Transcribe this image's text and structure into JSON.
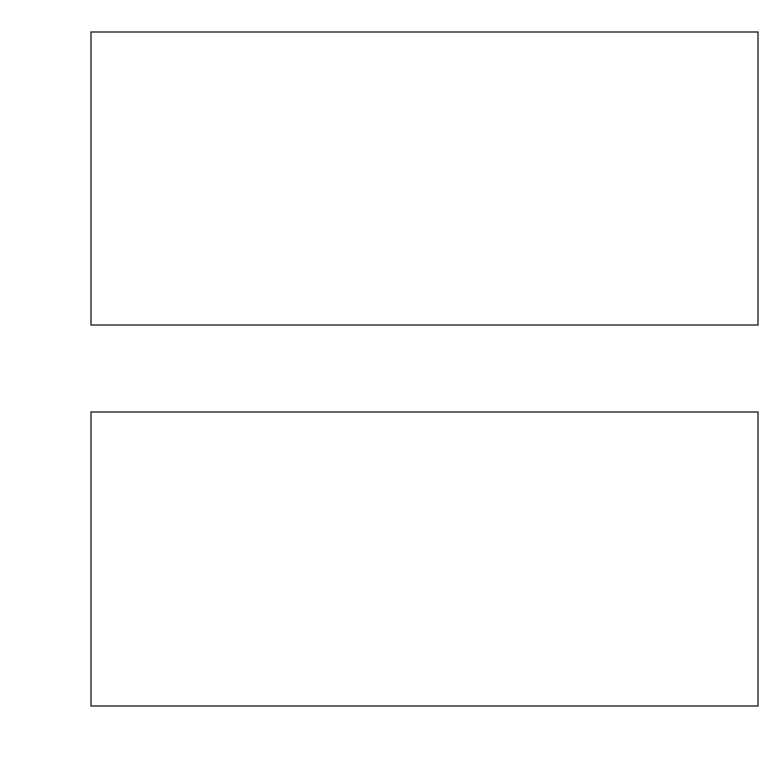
{
  "figure": {
    "background": "#ffffff",
    "line_color": "#1a1a1a",
    "hatch_color": "#2b2b2b",
    "clipped_caption": "planets per per"
  },
  "panels": [
    {
      "id": "top-panel",
      "name": "radial-distribution-panel",
      "xlabel": "R (kpc)",
      "ylabel_parts": {
        "pre": "N",
        "sub": "planets",
        "post": " / 0.1 kpc"
      },
      "ylabel_text": "N_planets / 0.1 kpc",
      "x_ticks": [
        "6",
        "7",
        "8",
        "9",
        "10"
      ],
      "y_ticks": [
        "0",
        "10",
        "2×10",
        "3×10",
        "4×10",
        "5×10"
      ],
      "y_tick_labels": [
        {
          "mantissa": "0",
          "exp": ""
        },
        {
          "mantissa": "10",
          "exp": "5"
        },
        {
          "mantissa": "2×10",
          "exp": "5"
        },
        {
          "mantissa": "3×10",
          "exp": "5"
        },
        {
          "mantissa": "4×10",
          "exp": "5"
        },
        {
          "mantissa": "5×10",
          "exp": "5"
        }
      ]
    },
    {
      "id": "bottom-panel",
      "name": "metallicity-distribution-panel",
      "xlabel": "[M/H]",
      "ylabel_parts": {
        "pre": "N",
        "sub": "planets",
        "post": "/0.1 dex"
      },
      "ylabel_text": "N_planets/0.1 dex",
      "x_ticks": [
        "-0.4",
        "-0.2",
        "0",
        "0.2",
        "0.4"
      ],
      "y_tick_labels": [
        {
          "mantissa": "0",
          "exp": ""
        },
        {
          "mantissa": "10",
          "exp": "6"
        },
        {
          "mantissa": "2×10",
          "exp": "6"
        }
      ]
    }
  ],
  "chart_data": [
    {
      "type": "area",
      "id": "radial-profile",
      "title": "",
      "xlabel": "R (kpc)",
      "ylabel": "N_planets / 0.1 kpc",
      "xlim": [
        5.955,
        10.11
      ],
      "ylim": [
        0,
        500000
      ],
      "xticks": [
        6,
        7,
        8,
        9,
        10
      ],
      "yticks": [
        0,
        100000,
        200000,
        300000,
        400000,
        500000
      ],
      "grid": false,
      "legend": null,
      "fill": "hatched-diagonal",
      "x": [
        5.955,
        6.1,
        6.3,
        6.5,
        6.7,
        6.9,
        7.1,
        7.3,
        7.5,
        7.7,
        7.9,
        8.1,
        8.3,
        8.5,
        8.7,
        8.9,
        9.1,
        9.3,
        9.5,
        9.7,
        9.9,
        10.11
      ],
      "y": [
        359000,
        350000,
        336000,
        322000,
        308000,
        295000,
        282000,
        269000,
        256000,
        244000,
        232000,
        221000,
        211000,
        201000,
        191000,
        182000,
        173000,
        164000,
        156000,
        148000,
        140000,
        132000
      ]
    },
    {
      "type": "bar",
      "id": "metallicity-histogram",
      "title": "",
      "xlabel": "[M/H]",
      "ylabel": "N_planets/0.1 dex",
      "xlim": [
        -0.545,
        0.45
      ],
      "ylim": [
        0,
        2720000
      ],
      "xticks": [
        -0.4,
        -0.2,
        0,
        0.2,
        0.4
      ],
      "yticks": [
        0,
        1000000,
        2000000
      ],
      "grid": false,
      "legend": null,
      "bin_width": 0.1,
      "fill": "hatched-diagonal",
      "bin_edges": [
        -0.545,
        -0.45,
        -0.35,
        -0.25,
        -0.15,
        -0.05,
        0.05,
        0.15,
        0.25,
        0.35,
        0.45
      ],
      "categories": [
        "-0.50",
        "-0.40",
        "-0.30",
        "-0.20",
        "-0.10",
        "0.00",
        "0.10",
        "0.20",
        "0.30",
        "0.40"
      ],
      "values": [
        2200000,
        1230000,
        1460000,
        2590000,
        0,
        1300000,
        0,
        0,
        0,
        0
      ]
    }
  ]
}
